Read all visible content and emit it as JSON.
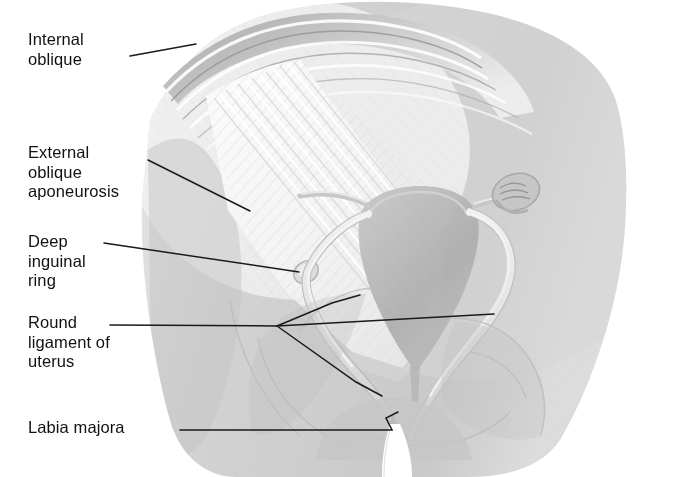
{
  "figure": {
    "background_color": "#ffffff",
    "label_color": "#111111",
    "leader_color": "#1a1a1a",
    "width": 679,
    "height": 477
  },
  "labels": [
    {
      "id": "internal-oblique",
      "text": "Internal\noblique"
    },
    {
      "id": "external-oblique",
      "text": "External\noblique\naponeurosis"
    },
    {
      "id": "deep-inguinal-ring",
      "text": "Deep\ninguinal\nring"
    },
    {
      "id": "round-ligament",
      "text": "Round\nligament of\nuterus"
    },
    {
      "id": "labia-majora",
      "text": "Labia majora"
    }
  ],
  "structures": [
    {
      "name": "internal-oblique-muscle",
      "tone": "#b6b6b6"
    },
    {
      "name": "external-oblique-aponeurosis",
      "tone": "#f2f2f2"
    },
    {
      "name": "abdominal-wall-silhouette",
      "tone": "#cfcfcf"
    },
    {
      "name": "uterus",
      "tone": "#b8b8b8"
    },
    {
      "name": "fallopian-tube",
      "tone": "#cacaca"
    },
    {
      "name": "ovary",
      "tone": "#c2c2c2"
    },
    {
      "name": "round-ligament-cord",
      "tone": "#e4e4e4"
    },
    {
      "name": "deep-inguinal-ring-opening",
      "tone": "#dedede"
    },
    {
      "name": "pelvic-bone-outline",
      "tone": "#bdbdbd"
    },
    {
      "name": "labia-majora-cleft",
      "tone": "#ffffff"
    }
  ]
}
